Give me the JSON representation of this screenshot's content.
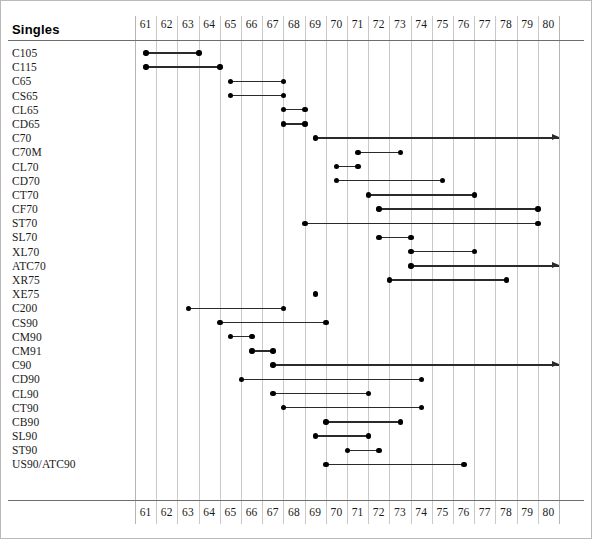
{
  "title": "Singles",
  "axis": {
    "ticks": [
      "61",
      "62",
      "63",
      "64",
      "65",
      "66",
      "67",
      "68",
      "69",
      "70",
      "71",
      "72",
      "73",
      "74",
      "75",
      "76",
      "77",
      "78",
      "79",
      "80"
    ],
    "min": 61,
    "max": 81,
    "show_top": true,
    "show_bottom": true
  },
  "chart_data": {
    "type": "bar",
    "title": "Singles",
    "xlabel": "",
    "ylabel": "",
    "xlim": [
      61,
      81
    ],
    "grid": true,
    "legend": false,
    "note": "Horizontal range (Gantt/timeline) chart. Each category is a production-period span with round end markers; arrow markers mean the span continues past the right axis limit (80).",
    "categories": [
      "C105",
      "C115",
      "C65",
      "CS65",
      "CL65",
      "CD65",
      "C70",
      "C70M",
      "CL70",
      "CD70",
      "CT70",
      "CF70",
      "ST70",
      "SL70",
      "XL70",
      "ATC70",
      "XR75",
      "XE75",
      "C200",
      "CS90",
      "CM90",
      "CM91",
      "C90",
      "CD90",
      "CL90",
      "CT90",
      "CB90",
      "SL90",
      "ST90",
      "US90/ATC90"
    ],
    "spans": [
      {
        "label": "C105",
        "start": 61.5,
        "end": 64.0,
        "open_ended": false
      },
      {
        "label": "C115",
        "start": 61.5,
        "end": 65.0,
        "open_ended": false
      },
      {
        "label": "C65",
        "start": 65.5,
        "end": 68.0,
        "open_ended": false
      },
      {
        "label": "CS65",
        "start": 65.5,
        "end": 68.0,
        "open_ended": false
      },
      {
        "label": "CL65",
        "start": 68.0,
        "end": 69.0,
        "open_ended": false
      },
      {
        "label": "CD65",
        "start": 68.0,
        "end": 69.0,
        "open_ended": false
      },
      {
        "label": "C70",
        "start": 69.5,
        "end": 81.0,
        "open_ended": true
      },
      {
        "label": "C70M",
        "start": 71.5,
        "end": 73.5,
        "open_ended": false
      },
      {
        "label": "CL70",
        "start": 70.5,
        "end": 71.5,
        "open_ended": false
      },
      {
        "label": "CD70",
        "start": 70.5,
        "end": 75.5,
        "open_ended": false
      },
      {
        "label": "CT70",
        "start": 72.0,
        "end": 77.0,
        "open_ended": false
      },
      {
        "label": "CF70",
        "start": 72.5,
        "end": 80.0,
        "open_ended": false
      },
      {
        "label": "ST70",
        "start": 69.0,
        "end": 80.0,
        "open_ended": false
      },
      {
        "label": "SL70",
        "start": 72.5,
        "end": 74.0,
        "open_ended": false
      },
      {
        "label": "XL70",
        "start": 74.0,
        "end": 77.0,
        "open_ended": false
      },
      {
        "label": "ATC70",
        "start": 74.0,
        "end": 81.0,
        "open_ended": true
      },
      {
        "label": "XR75",
        "start": 73.0,
        "end": 78.5,
        "open_ended": false
      },
      {
        "label": "XE75",
        "start": 69.5,
        "end": 69.5,
        "open_ended": false
      },
      {
        "label": "C200",
        "start": 63.5,
        "end": 68.0,
        "open_ended": false
      },
      {
        "label": "CS90",
        "start": 65.0,
        "end": 70.0,
        "open_ended": false
      },
      {
        "label": "CM90",
        "start": 65.5,
        "end": 66.5,
        "open_ended": false
      },
      {
        "label": "CM91",
        "start": 66.5,
        "end": 67.5,
        "open_ended": false
      },
      {
        "label": "C90",
        "start": 67.5,
        "end": 81.0,
        "open_ended": true
      },
      {
        "label": "CD90",
        "start": 66.0,
        "end": 74.5,
        "open_ended": false
      },
      {
        "label": "CL90",
        "start": 67.5,
        "end": 72.0,
        "open_ended": false
      },
      {
        "label": "CT90",
        "start": 68.0,
        "end": 74.5,
        "open_ended": false
      },
      {
        "label": "CB90",
        "start": 70.0,
        "end": 73.5,
        "open_ended": false
      },
      {
        "label": "SL90",
        "start": 69.5,
        "end": 72.0,
        "open_ended": false
      },
      {
        "label": "ST90",
        "start": 71.0,
        "end": 72.5,
        "open_ended": false
      },
      {
        "label": "US90/ATC90",
        "start": 70.0,
        "end": 76.5,
        "open_ended": false
      }
    ]
  },
  "colors": {
    "marker": "#000000",
    "line": "#2a2a2a",
    "grid": "#c9c9c9",
    "rule": "#6e6e6e",
    "text": "#1a1a1a",
    "background": "#ffffff"
  }
}
